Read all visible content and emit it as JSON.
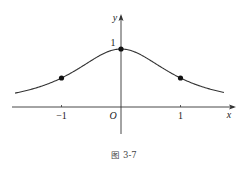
{
  "chart_data": {
    "type": "line",
    "function": "y = 1/(1+x^2)",
    "xlim": [
      -1.8,
      1.75
    ],
    "ylim": [
      -0.35,
      1.25
    ],
    "x_axis_label": "x",
    "y_axis_label": "y",
    "origin_label": "O",
    "x_ticks": [
      {
        "value": -1,
        "label": "−1"
      },
      {
        "value": 1,
        "label": "1"
      }
    ],
    "y_ticks": [
      {
        "value": 1,
        "label": "1"
      }
    ],
    "points": [
      {
        "x": -1,
        "y": 0.5
      },
      {
        "x": 0,
        "y": 1
      },
      {
        "x": 1,
        "y": 0.5
      }
    ],
    "curve_domain": [
      -1.78,
      1.73
    ],
    "grid": false,
    "legend": "none",
    "caption": "图  3-7"
  }
}
